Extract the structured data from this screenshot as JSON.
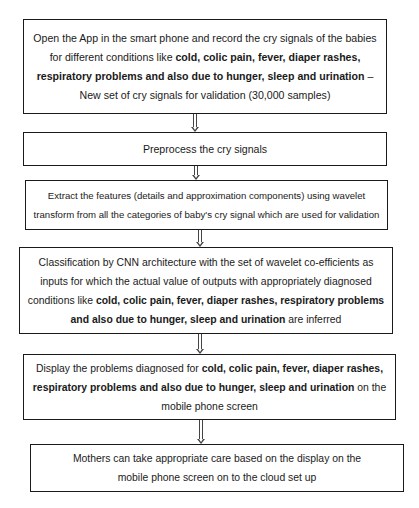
{
  "diagram": {
    "type": "flowchart",
    "steps": [
      {
        "id": "step-1",
        "segments": [
          {
            "text": "Open the App in the smart phone and record the cry signals of the babies for different conditions like ",
            "bold": false
          },
          {
            "text": "cold, colic pain, fever, diaper rashes, respiratory problems and also due to hunger, sleep and urination",
            "bold": true
          },
          {
            "text": " – New set of cry signals for validation (30,000 samples)",
            "bold": false
          }
        ]
      },
      {
        "id": "step-2",
        "segments": [
          {
            "text": "Preprocess the cry signals",
            "bold": false
          }
        ]
      },
      {
        "id": "step-3",
        "segments": [
          {
            "text": "Extract the features (details and approximation components) using wavelet transform from all the categories of baby's cry signal which are used for validation",
            "bold": false
          }
        ]
      },
      {
        "id": "step-4",
        "segments": [
          {
            "text": "Classification by CNN architecture with the set of wavelet co-efficients as inputs for which the actual value of outputs with appropriately diagnosed conditions like ",
            "bold": false
          },
          {
            "text": "cold, colic pain, fever, diaper rashes, respiratory problems and also due to hunger, sleep and urination",
            "bold": true
          },
          {
            "text": " are inferred",
            "bold": false
          }
        ]
      },
      {
        "id": "step-5",
        "segments": [
          {
            "text": "Display the problems diagnosed for ",
            "bold": false
          },
          {
            "text": "cold, colic pain, fever, diaper rashes, respiratory problems and also due to hunger, sleep and urination",
            "bold": true
          },
          {
            "text": " on the mobile phone screen",
            "bold": false
          }
        ]
      },
      {
        "id": "step-6",
        "segments": [
          {
            "text": "Mothers can take appropriate care based on the display on the mobile phone screen on to the cloud set up",
            "bold": false
          }
        ]
      }
    ],
    "edges": [
      {
        "from": "step-1",
        "to": "step-2",
        "style": "hollow-down-arrow"
      },
      {
        "from": "step-2",
        "to": "step-3",
        "style": "hollow-down-arrow"
      },
      {
        "from": "step-3",
        "to": "step-4",
        "style": "hollow-down-arrow"
      },
      {
        "from": "step-4",
        "to": "step-5",
        "style": "hollow-down-arrow"
      },
      {
        "from": "step-5",
        "to": "step-6",
        "style": "hollow-down-arrow"
      }
    ]
  }
}
